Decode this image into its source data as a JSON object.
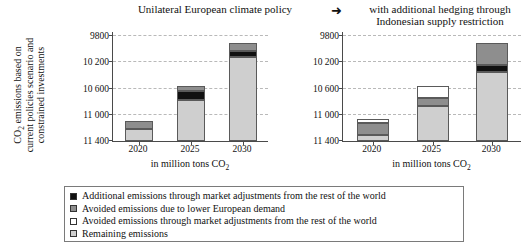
{
  "titles": {
    "left": "Unilateral European climate policy",
    "arrow": "➜",
    "right_line1": "with additional hedging through",
    "right_line2": "Indonesian supply restriction"
  },
  "axes": {
    "ylabel_line1": "CO2 emissions based on",
    "ylabel_line2": "current policies scenario and",
    "ylabel_line3": "constrained investments",
    "xlabel": "in million tons CO2",
    "ytick_labels": [
      "11 400",
      "11 000",
      "10 600",
      "10 200",
      "9800"
    ],
    "ytick_values": [
      11400,
      11000,
      10600,
      10200,
      9800
    ],
    "ymin": 9800,
    "ymax": 11480
  },
  "legend": {
    "items": [
      {
        "label": "Additional emissions through market adjustments from the rest of the world",
        "color": "#111111",
        "key": "additional"
      },
      {
        "label": "Avoided emissions due to lower European demand",
        "color": "#8e8e8e",
        "key": "avoided_demand"
      },
      {
        "label": "Avoided emissions through market adjustments from the rest of the world",
        "color": "#ffffff",
        "key": "avoided_market"
      },
      {
        "label": "Remaining emissions",
        "color": "#cfcfcf",
        "key": "remaining"
      }
    ]
  },
  "chart_data": {
    "type": "bar",
    "subtype": "stacked",
    "title": "Unilateral European climate policy ➜ with additional hedging through Indonesian supply restriction",
    "xlabel": "in million tons CO2",
    "ylabel": "CO2 emissions based on current policies scenario and constrained investments",
    "ylim": [
      9800,
      11480
    ],
    "yticks": [
      9800,
      10200,
      10600,
      11000,
      11400
    ],
    "grid": true,
    "legend_position": "bottom",
    "categories": [
      "2020",
      "2025",
      "2030"
    ],
    "panels": [
      {
        "name": "Unilateral European climate policy",
        "series": [
          {
            "name": "Remaining emissions",
            "color": "#cfcfcf",
            "values": [
              9990,
              10430,
              11080
            ]
          },
          {
            "name": "Additional emissions through market adjustments from the rest of the world",
            "color": "#111111",
            "values": [
              0,
              130,
              90
            ]
          },
          {
            "name": "Avoided emissions due to lower European demand",
            "color": "#8e8e8e",
            "values": [
              120,
              80,
              130
            ]
          },
          {
            "name": "Avoided emissions through market adjustments from the rest of the world",
            "color": "#ffffff",
            "values": [
              0,
              0,
              0
            ]
          }
        ],
        "totals": [
          10110,
          10640,
          11300
        ]
      },
      {
        "name": "with additional hedging through Indonesian supply restriction",
        "series": [
          {
            "name": "Remaining emissions",
            "color": "#cfcfcf",
            "values": [
              9890,
              10330,
              10860
            ]
          },
          {
            "name": "Additional emissions through market adjustments from the rest of the world",
            "color": "#111111",
            "values": [
              0,
              0,
              100
            ]
          },
          {
            "name": "Avoided emissions due to lower European demand",
            "color": "#8e8e8e",
            "values": [
              180,
              130,
              340
            ]
          },
          {
            "name": "Avoided emissions through market adjustments from the rest of the world",
            "color": "#ffffff",
            "values": [
              70,
              180,
              0
            ]
          }
        ],
        "totals": [
          10140,
          10640,
          11300
        ]
      }
    ]
  }
}
